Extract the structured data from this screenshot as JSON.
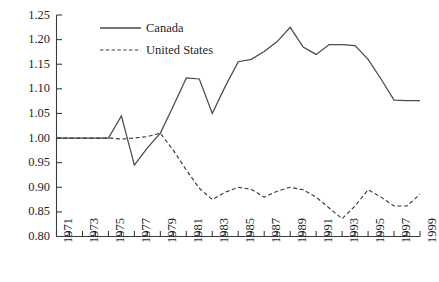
{
  "chart_data": {
    "type": "line",
    "title": "",
    "subtitle": "",
    "xlabel": "",
    "ylabel": "",
    "xlim": [
      1971,
      1999
    ],
    "ylim": [
      0.8,
      1.25
    ],
    "grid": false,
    "legend_position": "top-left",
    "x": [
      1971,
      1972,
      1973,
      1974,
      1975,
      1976,
      1977,
      1978,
      1979,
      1980,
      1981,
      1982,
      1983,
      1984,
      1985,
      1986,
      1987,
      1988,
      1989,
      1990,
      1991,
      1992,
      1993,
      1994,
      1995,
      1996,
      1997,
      1998,
      1999
    ],
    "xticks": [
      "1971",
      "1972",
      "1973",
      "1974",
      "1975",
      "1976",
      "1977",
      "1978",
      "1979",
      "1980",
      "1981",
      "1982",
      "1983",
      "1984",
      "1985",
      "1986",
      "1987",
      "1988",
      "1989",
      "1990",
      "1991",
      "1992",
      "1993",
      "1994",
      "1995",
      "1996",
      "1997",
      "1998",
      "1999"
    ],
    "xtick_labels_shown": [
      "1971",
      "1973",
      "1975",
      "1977",
      "1979",
      "1981",
      "1983",
      "1985",
      "1987",
      "1989",
      "1991",
      "1993",
      "1995",
      "1997",
      "1999"
    ],
    "yticks": [
      0.8,
      0.85,
      0.9,
      0.95,
      1.0,
      1.05,
      1.1,
      1.15,
      1.2,
      1.25
    ],
    "ytick_labels": [
      "0.80",
      "0.85",
      "0.90",
      "0.95",
      "1.00",
      "1.05",
      "1.10",
      "1.15",
      "1.20",
      "1.25"
    ],
    "series": [
      {
        "name": "Canada",
        "style": "solid",
        "color": "#4a4a4a",
        "values": [
          1.0,
          1.0,
          1.0,
          1.0,
          1.0,
          1.045,
          0.945,
          0.98,
          1.01,
          1.065,
          1.122,
          1.12,
          1.05,
          1.105,
          1.155,
          1.16,
          1.176,
          1.196,
          1.225,
          1.185,
          1.17,
          1.19,
          1.19,
          1.188,
          1.16,
          1.12,
          1.077,
          1.076,
          1.076
        ]
      },
      {
        "name": "United States",
        "style": "dashed",
        "color": "#3a3a3a",
        "values": [
          1.0,
          1.0,
          1.0,
          1.0,
          1.0,
          0.998,
          1.0,
          1.003,
          1.01,
          0.975,
          0.935,
          0.898,
          0.875,
          0.89,
          0.9,
          0.896,
          0.88,
          0.892,
          0.9,
          0.895,
          0.88,
          0.858,
          0.836,
          0.862,
          0.895,
          0.88,
          0.862,
          0.862,
          0.886
        ]
      }
    ]
  },
  "legend": {
    "entries": [
      {
        "label": "Canada",
        "style": "solid"
      },
      {
        "label": "United States",
        "style": "dashed"
      }
    ]
  }
}
